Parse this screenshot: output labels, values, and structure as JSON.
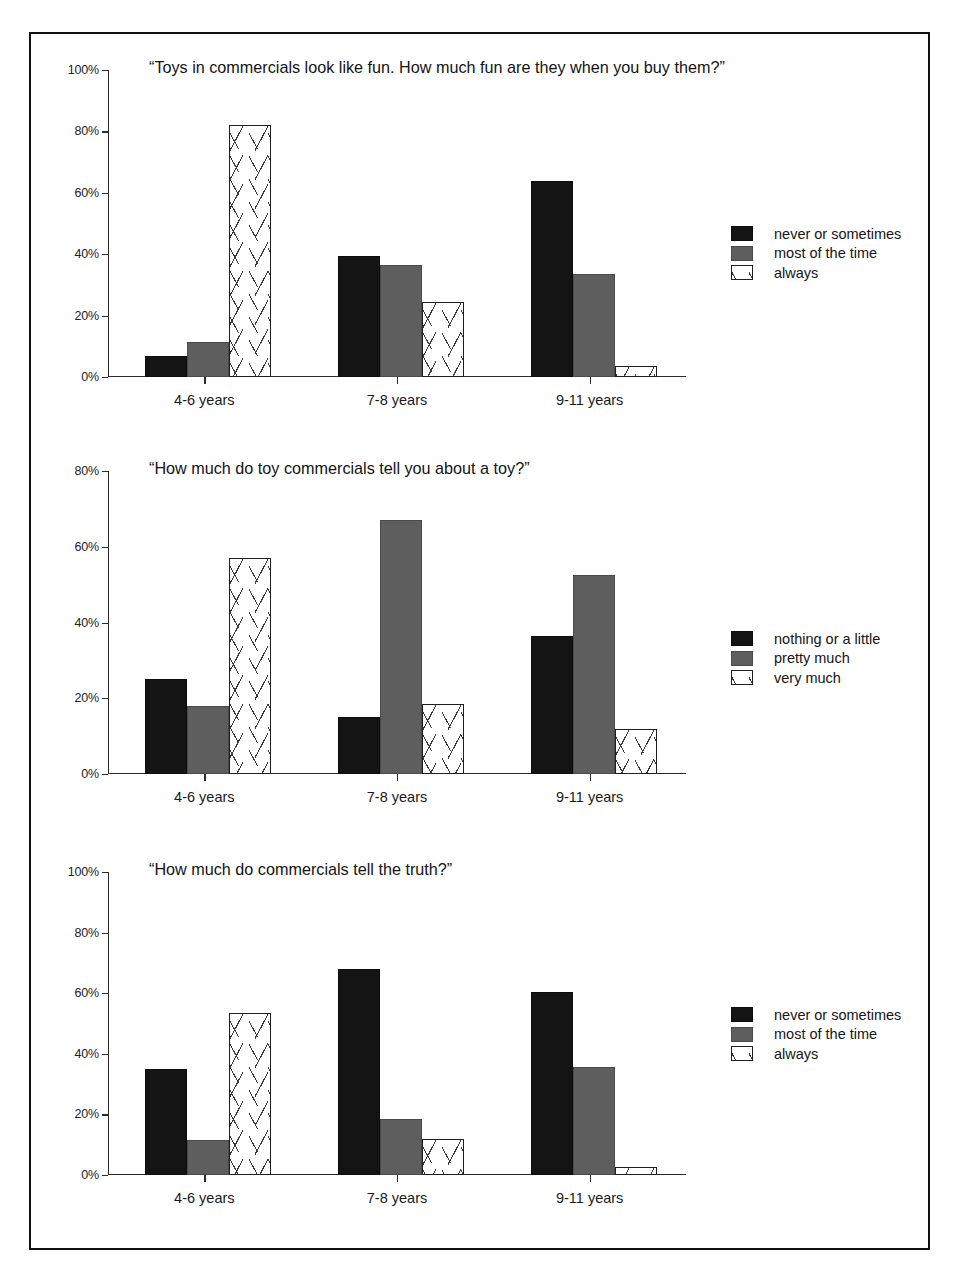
{
  "page": {
    "background": "#ffffff",
    "frame_color": "#111111"
  },
  "series_colors": {
    "series_1": "#141414",
    "series_2": "#5e5e5e",
    "series_3": "#ffffff"
  },
  "charts": [
    {
      "id": "chart-fun",
      "title": "“Toys in commercials look like fun. How much fun are they when you buy them?”",
      "categories": [
        "4-6 years",
        "7-8 years",
        "9-11 years"
      ],
      "yticks": [
        "0%",
        "20%",
        "40%",
        "60%",
        "80%",
        "100%"
      ],
      "legend": [
        "never or sometimes",
        "most of the time",
        "always"
      ]
    },
    {
      "id": "chart-tell-about-toy",
      "title": "“How much do toy commercials tell you about a toy?”",
      "categories": [
        "4-6 years",
        "7-8 years",
        "9-11 years"
      ],
      "yticks": [
        "0%",
        "20%",
        "40%",
        "60%",
        "80%"
      ],
      "legend": [
        "nothing or a little",
        "pretty much",
        "very much"
      ]
    },
    {
      "id": "chart-truth",
      "title": "“How much do commercials tell the truth?”",
      "categories": [
        "4-6 years",
        "7-8 years",
        "9-11 years"
      ],
      "yticks": [
        "0%",
        "20%",
        "40%",
        "60%",
        "80%",
        "100%"
      ],
      "legend": [
        "never or sometimes",
        "most of the time",
        "always"
      ]
    }
  ],
  "chart_data": [
    {
      "type": "bar",
      "title": "“Toys in commercials look like fun. How much fun are they when you buy them?”",
      "xlabel": "",
      "ylabel": "",
      "ylim": [
        0,
        100
      ],
      "ytick_values": [
        0,
        20,
        40,
        60,
        80,
        100
      ],
      "ytick_labels": [
        "0%",
        "20%",
        "40%",
        "60%",
        "80%",
        "100%"
      ],
      "categories": [
        "4-6 years",
        "7-8 years",
        "9-11 years"
      ],
      "grid": false,
      "legend_position": "right",
      "series": [
        {
          "name": "never or sometimes",
          "color": "#141414",
          "values": [
            7,
            39.5,
            64
          ]
        },
        {
          "name": "most of the time",
          "color": "#5e5e5e",
          "values": [
            11.5,
            36.5,
            33.5
          ]
        },
        {
          "name": "always",
          "color": "#ffffff",
          "values": [
            82,
            24.5,
            3.5
          ]
        }
      ]
    },
    {
      "type": "bar",
      "title": "“How much do toy commercials tell you about a toy?”",
      "xlabel": "",
      "ylabel": "",
      "ylim": [
        0,
        80
      ],
      "ytick_values": [
        0,
        20,
        40,
        60,
        80
      ],
      "ytick_labels": [
        "0%",
        "20%",
        "40%",
        "60%",
        "80%"
      ],
      "categories": [
        "4-6 years",
        "7-8 years",
        "9-11 years"
      ],
      "grid": false,
      "legend_position": "right",
      "series": [
        {
          "name": "nothing or a little",
          "color": "#141414",
          "values": [
            25,
            15,
            36.5
          ]
        },
        {
          "name": "pretty much",
          "color": "#5e5e5e",
          "values": [
            18,
            67,
            52.5
          ]
        },
        {
          "name": "very much",
          "color": "#ffffff",
          "values": [
            57,
            18.5,
            12
          ]
        }
      ]
    },
    {
      "type": "bar",
      "title": "“How much do commercials tell the truth?”",
      "xlabel": "",
      "ylabel": "",
      "ylim": [
        0,
        100
      ],
      "ytick_values": [
        0,
        20,
        40,
        60,
        80,
        100
      ],
      "ytick_labels": [
        "0%",
        "20%",
        "40%",
        "60%",
        "80%",
        "100%"
      ],
      "categories": [
        "4-6 years",
        "7-8 years",
        "9-11 years"
      ],
      "grid": false,
      "legend_position": "right",
      "series": [
        {
          "name": "never or sometimes",
          "color": "#141414",
          "values": [
            35,
            68,
            60.5
          ]
        },
        {
          "name": "most of the time",
          "color": "#5e5e5e",
          "values": [
            11.5,
            18.5,
            35.5
          ]
        },
        {
          "name": "always",
          "color": "#ffffff",
          "values": [
            53.5,
            12,
            2.5
          ]
        }
      ]
    }
  ]
}
